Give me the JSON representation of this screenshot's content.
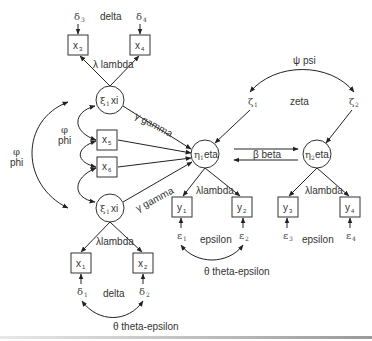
{
  "diagram": {
    "type": "structural-equation-model",
    "exogenous_latents": [
      {
        "id": "xi1_top",
        "symbol": "ξ",
        "sub": "1",
        "label": "xi"
      },
      {
        "id": "xi1_bottom",
        "symbol": "ξ",
        "sub": "1",
        "label": "xi"
      }
    ],
    "endogenous_latents": [
      {
        "id": "eta1",
        "symbol": "η",
        "sub": "1",
        "label": "eta"
      },
      {
        "id": "eta2",
        "symbol": "η",
        "sub": "2",
        "label": "eta"
      }
    ],
    "x_indicators": [
      {
        "id": "x1",
        "name": "x",
        "sub": "1"
      },
      {
        "id": "x2",
        "name": "x",
        "sub": "2"
      },
      {
        "id": "x3",
        "name": "x",
        "sub": "3"
      },
      {
        "id": "x4",
        "name": "x",
        "sub": "4"
      },
      {
        "id": "x5",
        "name": "x",
        "sub": "5"
      },
      {
        "id": "x6",
        "name": "x",
        "sub": "6"
      }
    ],
    "y_indicators": [
      {
        "id": "y1",
        "name": "y",
        "sub": "1"
      },
      {
        "id": "y2",
        "name": "y",
        "sub": "2"
      },
      {
        "id": "y3",
        "name": "y",
        "sub": "3"
      },
      {
        "id": "y4",
        "name": "y",
        "sub": "4"
      }
    ],
    "errors": {
      "delta": [
        {
          "sym": "δ",
          "sub": "1"
        },
        {
          "sym": "δ",
          "sub": "2"
        },
        {
          "sym": "δ",
          "sub": "3"
        },
        {
          "sym": "δ",
          "sub": "4"
        }
      ],
      "epsilon": [
        {
          "sym": "ε",
          "sub": "1"
        },
        {
          "sym": "ε",
          "sub": "2"
        },
        {
          "sym": "ε",
          "sub": "3"
        },
        {
          "sym": "ε",
          "sub": "4"
        }
      ],
      "zeta": [
        {
          "sym": "ζ",
          "sub": "1"
        },
        {
          "sym": "ζ",
          "sub": "2"
        }
      ]
    },
    "labels": {
      "delta_top": "delta",
      "delta_bottom": "delta",
      "lambda_top": "λ lambda",
      "lambda_bottom": "λlambda",
      "lambda_eta1": "λlambda",
      "lambda_eta2": "λlambda",
      "gamma_top": "γ gamma",
      "gamma_bottom": "γ gamma",
      "phi_outer_symbol": "φ",
      "phi_outer_word": "phi",
      "phi_inner_symbol": "φ",
      "phi_inner_word": "phi",
      "psi": "ψ psi",
      "zeta": "zeta",
      "beta": "β beta",
      "epsilon_left": "epsilon",
      "epsilon_right": "epsilon",
      "theta_epsilon_y": "θ theta-epsilon",
      "theta_delta_x": "θ theta-epsilon"
    }
  }
}
